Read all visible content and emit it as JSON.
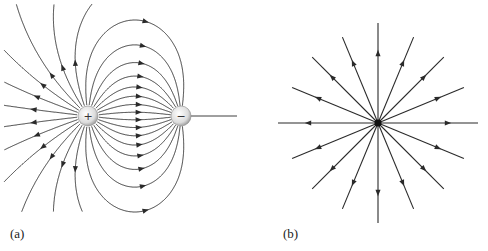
{
  "figure": {
    "panel_a": {
      "label": "(a)",
      "description": "Electric field lines of an electric dipole",
      "positive_charge": {
        "symbol": "+",
        "cx": 88,
        "cy": 116,
        "r": 10
      },
      "negative_charge": {
        "symbol": "−",
        "cx": 181,
        "cy": 116,
        "r": 10
      }
    },
    "panel_b": {
      "label": "(b)",
      "description": "Radial electric field lines of a point charge",
      "center": {
        "cx": 378,
        "cy": 123
      },
      "line_count": 16,
      "outer_radius": 100
    },
    "colors": {
      "line": "#2a2a2a",
      "charge_fill": "#e4e4e4",
      "background": "#ffffff"
    }
  }
}
